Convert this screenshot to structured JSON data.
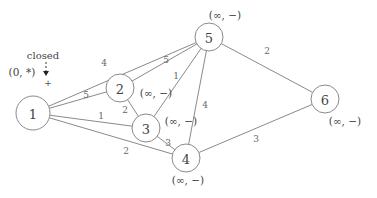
{
  "diagram": {
    "type": "weighted-undirected-graph",
    "nodes": [
      {
        "id": "1",
        "label": "1",
        "x": 33,
        "y": 113,
        "r": 17,
        "state": "(0, *)",
        "state_x": 22,
        "state_y": 72
      },
      {
        "id": "2",
        "label": "2",
        "x": 120,
        "y": 88,
        "r": 14,
        "state": "(∞, −)",
        "state_x": 156,
        "state_y": 93
      },
      {
        "id": "3",
        "label": "3",
        "x": 146,
        "y": 128,
        "r": 14,
        "state": "(∞, −)",
        "state_x": 181,
        "state_y": 121
      },
      {
        "id": "4",
        "label": "4",
        "x": 186,
        "y": 158,
        "r": 14,
        "state": "(∞, −)",
        "state_x": 188,
        "state_y": 180
      },
      {
        "id": "5",
        "label": "5",
        "x": 209,
        "y": 37,
        "r": 14,
        "state": "(∞, −)",
        "state_x": 225,
        "state_y": 15
      },
      {
        "id": "6",
        "label": "6",
        "x": 325,
        "y": 99,
        "r": 14,
        "state": "(∞, −)",
        "state_x": 345,
        "state_y": 121
      }
    ],
    "edges": [
      {
        "from": "1",
        "to": "5",
        "weight": "4",
        "lx": 104,
        "ly": 63
      },
      {
        "from": "1",
        "to": "2",
        "weight": "5",
        "lx": 86,
        "ly": 95
      },
      {
        "from": "1",
        "to": "3",
        "weight": "1",
        "lx": 101,
        "ly": 116
      },
      {
        "from": "1",
        "to": "4",
        "weight": "2",
        "lx": 126,
        "ly": 151
      },
      {
        "from": "2",
        "to": "5",
        "weight": "5",
        "lx": 166,
        "ly": 60
      },
      {
        "from": "2",
        "to": "3",
        "weight": "2",
        "lx": 125,
        "ly": 110
      },
      {
        "from": "3",
        "to": "5",
        "weight": "1",
        "lx": 176,
        "ly": 76
      },
      {
        "from": "3",
        "to": "4",
        "weight": "3",
        "lx": 168,
        "ly": 143
      },
      {
        "from": "4",
        "to": "5",
        "weight": "4",
        "lx": 205,
        "ly": 105
      },
      {
        "from": "5",
        "to": "6",
        "weight": "2",
        "lx": 267,
        "ly": 51
      },
      {
        "from": "4",
        "to": "6",
        "weight": "3",
        "lx": 256,
        "ly": 139
      }
    ],
    "annotation": {
      "text": "closed",
      "x": 43,
      "y": 55,
      "arrow_x": 46,
      "arrow_y1": 62,
      "arrow_y2": 76,
      "plus": "+",
      "plus_x": 48,
      "plus_y": 83
    }
  }
}
